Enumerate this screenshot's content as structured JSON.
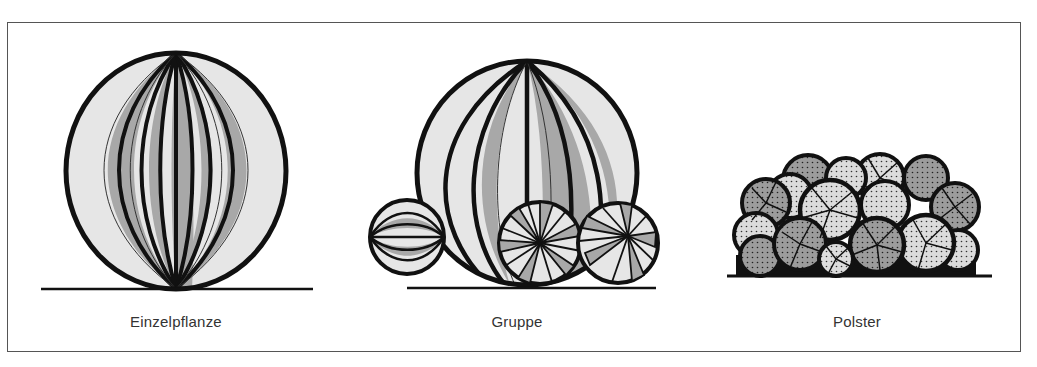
{
  "figure": {
    "panels": [
      {
        "id": "einzelpflanze",
        "label": "Einzelpflanze",
        "center_x": 176
      },
      {
        "id": "gruppe",
        "label": "Gruppe",
        "center_x": 517
      },
      {
        "id": "polster",
        "label": "Polster",
        "center_x": 857
      }
    ]
  },
  "colors": {
    "outline": "#111111",
    "light_fill": "#e6e6e6",
    "mid_fill": "#a8a8a8",
    "frame": "#555555",
    "label": "#333333"
  }
}
